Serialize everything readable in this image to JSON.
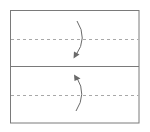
{
  "diagram": {
    "type": "origami-fold-step",
    "colors": {
      "outline": "#7a7a7a",
      "fold_line": "#a8a8a8",
      "arrow": "#6a6a6a",
      "background": "#ffffff"
    },
    "paper": {
      "x": 10,
      "y": 10,
      "width": 129,
      "height": 113
    },
    "center_crease": {
      "y": 66.5
    },
    "valley_folds": [
      {
        "y": 39,
        "label": "upper-valley-fold"
      },
      {
        "y": 95,
        "label": "lower-valley-fold"
      }
    ],
    "arrows": [
      {
        "name": "fold-down-arrow",
        "direction": "down"
      },
      {
        "name": "fold-up-arrow",
        "direction": "up"
      }
    ]
  }
}
